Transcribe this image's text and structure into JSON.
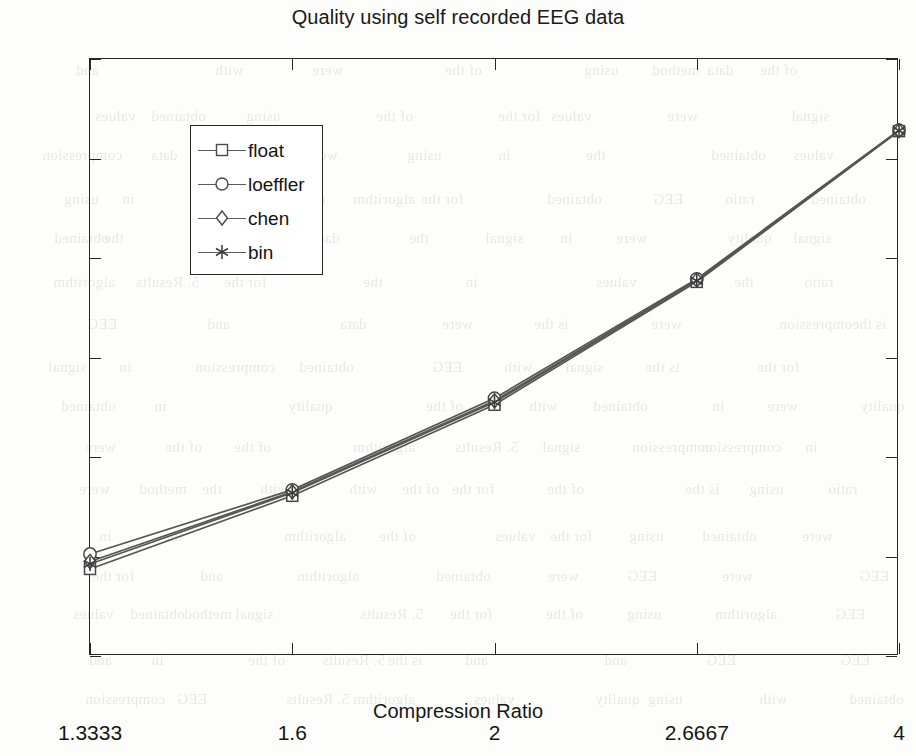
{
  "chart_data": {
    "type": "line",
    "title": "Quality using self recorded EEG data",
    "xlabel": "Compression Ratio",
    "ylabel": "PRD, %",
    "x": [
      1.3333,
      1.6,
      2,
      2.6667,
      4
    ],
    "xtick_labels": [
      "1.3333",
      "1.6",
      "2",
      "2.6667",
      "4"
    ],
    "ytick_labels": [
      "0",
      "2",
      "4",
      "6",
      "8",
      "10",
      "12"
    ],
    "ylim": [
      0,
      12
    ],
    "ytick_step": 2,
    "x_axis_scale": "reciprocal",
    "grid": false,
    "legend_position": "upper-left-inside",
    "series": [
      {
        "name": "float",
        "marker": "square",
        "values": [
          1.75,
          3.22,
          5.05,
          7.52,
          10.55
        ]
      },
      {
        "name": "loeffler",
        "marker": "circle",
        "values": [
          2.05,
          3.34,
          5.18,
          7.58,
          10.57
        ]
      },
      {
        "name": "chen",
        "marker": "diamond",
        "values": [
          1.9,
          3.3,
          5.13,
          7.56,
          10.56
        ]
      },
      {
        "name": "bin",
        "marker": "star",
        "values": [
          1.85,
          3.28,
          5.1,
          7.54,
          10.56
        ]
      }
    ]
  },
  "legend": {
    "entries": [
      {
        "label": "float"
      },
      {
        "label": "loeffler"
      },
      {
        "label": "chen"
      },
      {
        "label": "bin"
      }
    ]
  },
  "background_bleed": {
    "lines": [
      "5. Results",
      "of the",
      "for the",
      "compression",
      "using",
      "the",
      "is the",
      "data",
      "quality",
      "ratio",
      "and",
      "in",
      "obtained",
      "with",
      "values",
      "algorithm",
      "signal",
      "were",
      "EEG",
      "method"
    ]
  }
}
